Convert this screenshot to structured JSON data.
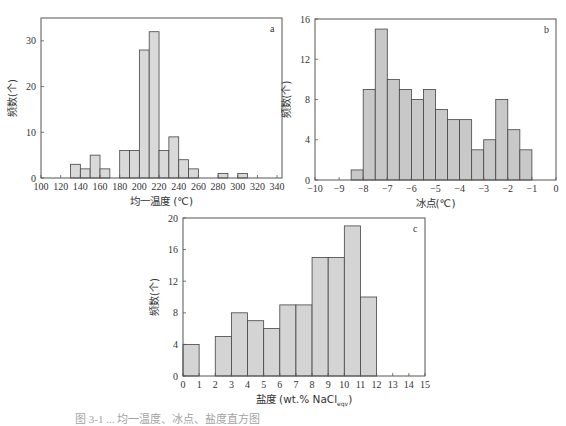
{
  "chart_data": [
    {
      "id": "a",
      "type": "bar",
      "panel_label": "a",
      "title": "",
      "xlabel": "均一温度 (℃)",
      "ylabel": "频数(个)",
      "bin_width": 10,
      "bins": [
        {
          "x0": 130,
          "x1": 140,
          "value": 3
        },
        {
          "x0": 140,
          "x1": 150,
          "value": 2
        },
        {
          "x0": 150,
          "x1": 160,
          "value": 5
        },
        {
          "x0": 160,
          "x1": 170,
          "value": 2
        },
        {
          "x0": 180,
          "x1": 190,
          "value": 6
        },
        {
          "x0": 190,
          "x1": 200,
          "value": 6
        },
        {
          "x0": 200,
          "x1": 210,
          "value": 28
        },
        {
          "x0": 210,
          "x1": 220,
          "value": 32
        },
        {
          "x0": 220,
          "x1": 230,
          "value": 6
        },
        {
          "x0": 230,
          "x1": 240,
          "value": 9
        },
        {
          "x0": 240,
          "x1": 250,
          "value": 4
        },
        {
          "x0": 250,
          "x1": 260,
          "value": 2
        },
        {
          "x0": 280,
          "x1": 290,
          "value": 1
        },
        {
          "x0": 300,
          "x1": 310,
          "value": 1
        }
      ],
      "xlim": [
        100,
        345
      ],
      "ylim": [
        0,
        35
      ],
      "xticks": [
        100,
        120,
        140,
        160,
        180,
        200,
        220,
        240,
        260,
        280,
        300,
        320,
        340
      ],
      "yticks": [
        0,
        10,
        20,
        30
      ],
      "grid": false,
      "legend": null
    },
    {
      "id": "b",
      "type": "bar",
      "panel_label": "b",
      "title": "",
      "xlabel": "冰点(℃)",
      "ylabel": "频数(个)",
      "bin_width": 0.5,
      "bins": [
        {
          "x0": -8.5,
          "x1": -8.0,
          "value": 1
        },
        {
          "x0": -8.0,
          "x1": -7.5,
          "value": 9
        },
        {
          "x0": -7.5,
          "x1": -7.0,
          "value": 15
        },
        {
          "x0": -7.0,
          "x1": -6.5,
          "value": 10
        },
        {
          "x0": -6.5,
          "x1": -6.0,
          "value": 9
        },
        {
          "x0": -6.0,
          "x1": -5.5,
          "value": 8
        },
        {
          "x0": -5.5,
          "x1": -5.0,
          "value": 9
        },
        {
          "x0": -5.0,
          "x1": -4.5,
          "value": 7
        },
        {
          "x0": -4.5,
          "x1": -4.0,
          "value": 6
        },
        {
          "x0": -4.0,
          "x1": -3.5,
          "value": 6
        },
        {
          "x0": -3.5,
          "x1": -3.0,
          "value": 3
        },
        {
          "x0": -3.0,
          "x1": -2.5,
          "value": 4
        },
        {
          "x0": -2.5,
          "x1": -2.0,
          "value": 8
        },
        {
          "x0": -2.0,
          "x1": -1.5,
          "value": 5
        },
        {
          "x0": -1.5,
          "x1": -1.0,
          "value": 3
        }
      ],
      "xlim": [
        -10,
        0
      ],
      "ylim": [
        0,
        16
      ],
      "xticks": [
        -10,
        -9,
        -8,
        -7,
        -6,
        -5,
        -4,
        -3,
        -2,
        -1,
        0
      ],
      "yticks": [
        0,
        4,
        8,
        12,
        16
      ],
      "grid": false,
      "legend": null
    },
    {
      "id": "c",
      "type": "bar",
      "panel_label": "c",
      "title": "",
      "xlabel": "盐度 (wt.% NaCl",
      "xlabel_sub": "eqv",
      "xlabel_end": ")",
      "ylabel": "频数(个)",
      "bin_width": 1,
      "bins": [
        {
          "x0": 0,
          "x1": 1,
          "value": 4
        },
        {
          "x0": 2,
          "x1": 3,
          "value": 5
        },
        {
          "x0": 3,
          "x1": 4,
          "value": 8
        },
        {
          "x0": 4,
          "x1": 5,
          "value": 7
        },
        {
          "x0": 5,
          "x1": 6,
          "value": 6
        },
        {
          "x0": 6,
          "x1": 7,
          "value": 9
        },
        {
          "x0": 7,
          "x1": 8,
          "value": 9
        },
        {
          "x0": 8,
          "x1": 9,
          "value": 15
        },
        {
          "x0": 9,
          "x1": 10,
          "value": 15
        },
        {
          "x0": 10,
          "x1": 11,
          "value": 19
        },
        {
          "x0": 11,
          "x1": 12,
          "value": 10
        }
      ],
      "xlim": [
        0,
        15
      ],
      "ylim": [
        0,
        20
      ],
      "xticks": [
        0,
        1,
        2,
        3,
        4,
        5,
        6,
        7,
        8,
        9,
        10,
        11,
        12,
        13,
        14,
        15
      ],
      "yticks": [
        0,
        4,
        8,
        12,
        16,
        20
      ],
      "grid": false,
      "legend": null
    }
  ],
  "layout": {
    "panels": {
      "a": {
        "left": 41,
        "top": 18,
        "right": 282,
        "bottom": 178,
        "fill": "#d9d9d9",
        "tick_fmt": "int"
      },
      "b": {
        "left": 315,
        "top": 19,
        "right": 556,
        "bottom": 180,
        "fill": "#c8c8c8",
        "tick_fmt": "int"
      },
      "c": {
        "left": 183,
        "top": 218,
        "right": 425,
        "bottom": 376,
        "fill": "#d4d4d4",
        "tick_fmt": "int"
      }
    }
  },
  "caption": "图 3-1  ... 均一温度、冰点、盐度直方图"
}
